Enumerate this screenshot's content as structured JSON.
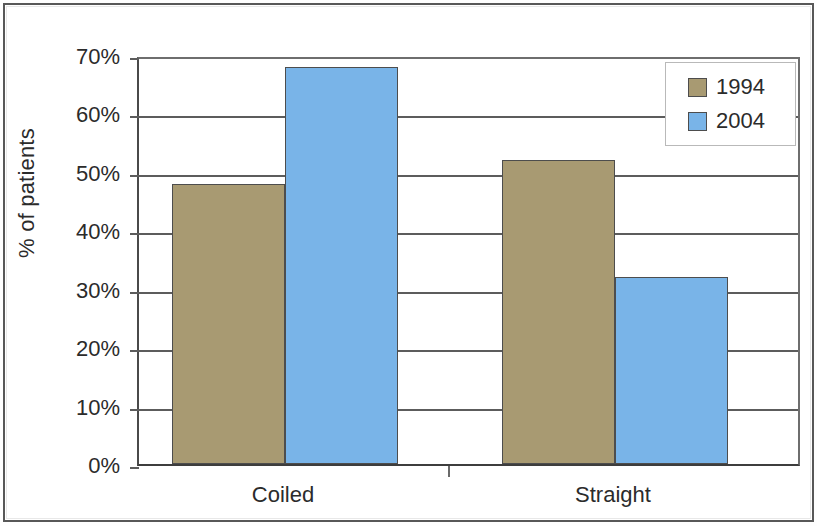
{
  "chart_data": {
    "type": "bar",
    "title": "",
    "xlabel": "",
    "ylabel": "% of patients",
    "categories": [
      "Coiled",
      "Straight"
    ],
    "series": [
      {
        "name": "1994",
        "color": "#a89a72",
        "values": [
          48,
          52
        ]
      },
      {
        "name": "2004",
        "color": "#79b4e8",
        "values": [
          68,
          32
        ]
      }
    ],
    "ylim": [
      0,
      70
    ],
    "ytick_labels": [
      "0%",
      "10%",
      "20%",
      "30%",
      "40%",
      "50%",
      "60%",
      "70%"
    ],
    "ytick_values": [
      0,
      10,
      20,
      30,
      40,
      50,
      60,
      70
    ],
    "grid": true,
    "legend_position": "top-right",
    "value_suffix": "%"
  },
  "legend": {
    "items": [
      {
        "label": "1994",
        "color": "#a89a72"
      },
      {
        "label": "2004",
        "color": "#79b4e8"
      }
    ]
  },
  "axes": {
    "y_title": "% of patients",
    "y_ticks": [
      "70%",
      "60%",
      "50%",
      "40%",
      "30%",
      "20%",
      "10%",
      "0%"
    ],
    "x_categories": [
      "Coiled",
      "Straight"
    ]
  }
}
